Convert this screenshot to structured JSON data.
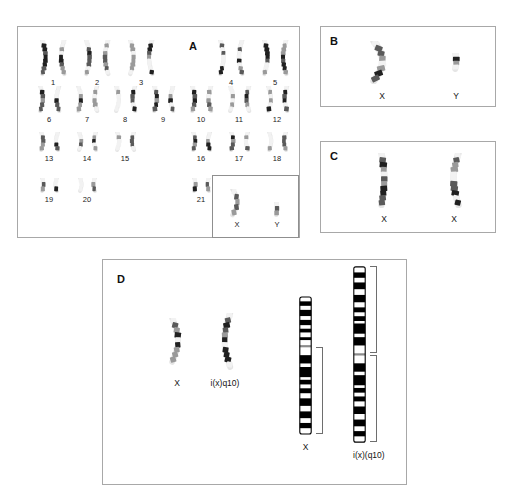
{
  "figure": {
    "type": "multi-panel-karyotype-figure",
    "background": "#ffffff",
    "border_color": "#a8a8a8",
    "panels": [
      "A",
      "B",
      "C",
      "D"
    ]
  },
  "panelA": {
    "letter": "A",
    "caption": "",
    "rows": [
      {
        "cells": [
          {
            "label": "1",
            "x": 18
          },
          {
            "label": "2",
            "x": 62
          },
          {
            "label": "3",
            "x": 106
          },
          {
            "label": "4",
            "x": 196
          },
          {
            "label": "5",
            "x": 240
          }
        ]
      },
      {
        "cells": [
          {
            "label": "6",
            "x": 14
          },
          {
            "label": "7",
            "x": 52
          },
          {
            "label": "8",
            "x": 90
          },
          {
            "label": "9",
            "x": 128
          },
          {
            "label": "10",
            "x": 166
          },
          {
            "label": "11",
            "x": 204
          },
          {
            "label": "12",
            "x": 242
          }
        ]
      },
      {
        "cells": [
          {
            "label": "13",
            "x": 14
          },
          {
            "label": "14",
            "x": 52
          },
          {
            "label": "15",
            "x": 90
          },
          {
            "label": "16",
            "x": 166
          },
          {
            "label": "17",
            "x": 204
          },
          {
            "label": "18",
            "x": 242
          }
        ]
      },
      {
        "cells": [
          {
            "label": "19",
            "x": 14
          },
          {
            "label": "20",
            "x": 52
          },
          {
            "label": "21",
            "x": 166
          },
          {
            "label": "22",
            "x": 204
          }
        ]
      }
    ],
    "sex_box": {
      "items": [
        {
          "label": "X",
          "x": 4
        },
        {
          "label": "Y",
          "x": 44
        }
      ]
    }
  },
  "panelB": {
    "letter": "B",
    "items": [
      {
        "label": "X",
        "x": 44
      },
      {
        "label": "Y",
        "x": 118
      }
    ]
  },
  "panelC": {
    "letter": "C",
    "items": [
      {
        "label": "X",
        "x": 46
      },
      {
        "label": "X",
        "x": 116
      }
    ]
  },
  "panelD": {
    "letter": "D",
    "photos": [
      {
        "label": "X",
        "x": 48
      },
      {
        "label": "i(x)q10)",
        "x": 96
      }
    ],
    "ideograms": [
      {
        "label": "X",
        "x": 196,
        "type": "normal-x",
        "bracket": "q-arm"
      },
      {
        "label": "i(x)(q10)",
        "x": 250,
        "type": "isochromosome-xq",
        "brackets": [
          "q-arm-upper",
          "q-arm-lower"
        ]
      }
    ]
  }
}
